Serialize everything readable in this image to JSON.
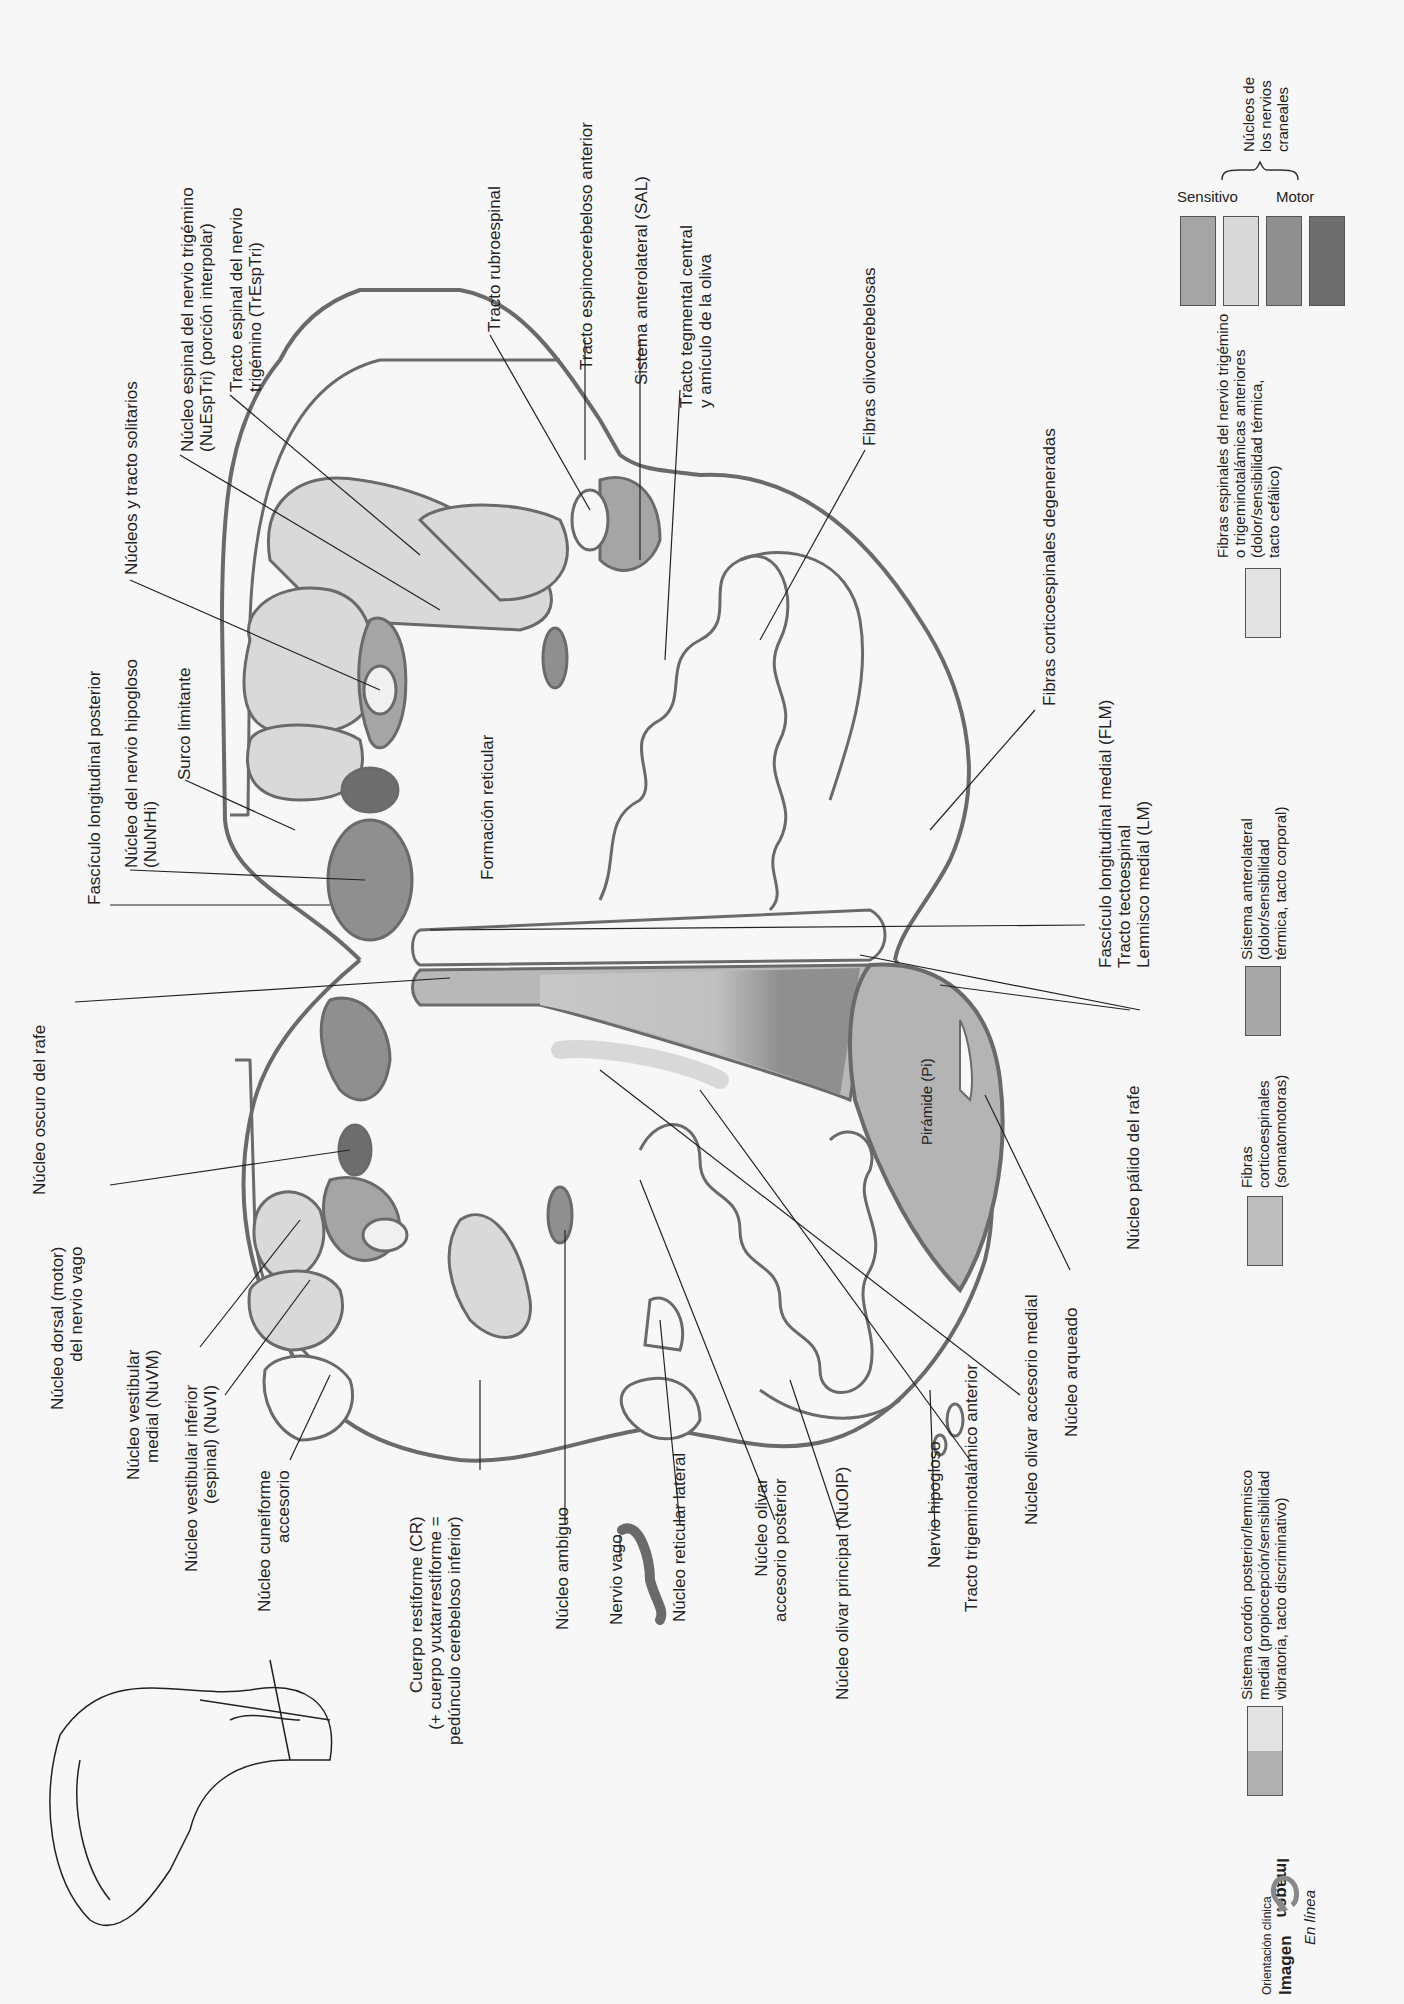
{
  "diagram": {
    "colors": {
      "outline": "#6a6a6a",
      "sensory_medium": "#a5a5a5",
      "sensory_light": "#d9d9d9",
      "motor_medium": "#8f8f8f",
      "motor_dark": "#6e6e6e",
      "pyramid": "#b4b4b4",
      "anterolateral": "#a8a8a8",
      "trigeminal_fibers": "#e3e3e3",
      "background": "#f7f7f7"
    }
  },
  "labels_top": [
    {
      "id": "fasciculo-longitudinal-posterior",
      "lines": [
        "Fascículo longitudinal posterior"
      ]
    },
    {
      "id": "nucleo-hipogloso",
      "lines": [
        "Núcleo del nervio hipogloso",
        "(NuNrHi)"
      ]
    },
    {
      "id": "surco-limitante",
      "lines": [
        "Surco limitante"
      ]
    },
    {
      "id": "nucleos-tracto-solitarios",
      "lines": [
        "Núcleos y tracto solitarios"
      ]
    },
    {
      "id": "nucleo-espinal-trigemino",
      "lines": [
        "Núcleo espinal del nervio trigémino",
        "(NuEspTri) (porción interpolar)"
      ]
    },
    {
      "id": "tracto-espinal-trigemino",
      "lines": [
        "Tracto espinal del nervio",
        "trigémino (TrEspTri)"
      ]
    },
    {
      "id": "tracto-rubroespinal",
      "lines": [
        "Tracto rubroespinal"
      ]
    },
    {
      "id": "tracto-espinocerebeloso-anterior",
      "lines": [
        "Tracto espinocerebeloso anterior"
      ]
    },
    {
      "id": "sistema-anterolateral",
      "lines": [
        "Sistema anterolateral (SAL)"
      ]
    },
    {
      "id": "tracto-tegmental-central",
      "lines": [
        "Tracto tegmental central",
        "y amículo de la oliva"
      ]
    },
    {
      "id": "fibras-olivocerebelosas",
      "lines": [
        "Fibras olivocerebelosas"
      ]
    },
    {
      "id": "fibras-corticoespinales-degeneradas",
      "lines": [
        "Fibras corticoespinales degeneradas"
      ]
    },
    {
      "id": "flm-group",
      "lines": [
        "Fascículo longitudinal medial (FLM)",
        "Tracto tectoespinal",
        "Lemnisco medial (LM)"
      ]
    },
    {
      "id": "formacion-reticular",
      "lines": [
        "Formación reticular"
      ]
    },
    {
      "id": "piramide",
      "lines": [
        "Pirámide (Pi)"
      ]
    }
  ],
  "labels_bottom": [
    {
      "id": "nucleo-oscuro-rafe",
      "lines": [
        "Núcleo oscuro del rafe"
      ]
    },
    {
      "id": "nucleo-dorsal-vago",
      "lines": [
        "Núcleo dorsal (motor)",
        "del nervio vago"
      ]
    },
    {
      "id": "nucleo-vestibular-medial",
      "lines": [
        "Núcleo vestibular",
        "medial (NuVM)"
      ]
    },
    {
      "id": "nucleo-vestibular-inferior",
      "lines": [
        "Núcleo vestibular inferior",
        "(espinal) (NuVI)"
      ]
    },
    {
      "id": "nucleo-cuneiforme-accesorio",
      "lines": [
        "Núcleo cuneiforme",
        "accesorio"
      ]
    },
    {
      "id": "cuerpo-restiforme",
      "lines": [
        "Cuerpo restiforme (CR)",
        "(+ cuerpo yuxtarrestiforme =",
        "pedúnculo cerebeloso inferior)"
      ]
    },
    {
      "id": "nucleo-ambiguo",
      "lines": [
        "Núcleo ambiguo"
      ]
    },
    {
      "id": "nervio-vago",
      "lines": [
        "Nervio vago"
      ]
    },
    {
      "id": "nucleo-reticular-lateral",
      "lines": [
        "Núcleo reticular lateral"
      ]
    },
    {
      "id": "nucleo-olivar-accesorio-posterior",
      "lines": [
        "Núcleo olivar",
        "accesorio posterior"
      ]
    },
    {
      "id": "nucleo-olivar-principal",
      "lines": [
        "Núcleo olivar principal (NuOIP)"
      ]
    },
    {
      "id": "nervio-hipogloso",
      "lines": [
        "Nervio hipogloso"
      ]
    },
    {
      "id": "tracto-trigeminotalamico-anterior",
      "lines": [
        "Tracto trigeminotalámico anterior"
      ]
    },
    {
      "id": "nucleo-olivar-accesorio-medial",
      "lines": [
        "Núcleo olivar accesorio medial"
      ]
    },
    {
      "id": "nucleo-arqueado",
      "lines": [
        "Núcleo arqueado"
      ]
    },
    {
      "id": "nucleo-palido-rafe",
      "lines": [
        "Núcleo pálido del rafe"
      ]
    }
  ],
  "legend": {
    "cranial_nuclei": {
      "title_lines": [
        "Núcleos de",
        "los nervios",
        "craneales"
      ],
      "sensory_label": "Sensitivo",
      "motor_label": "Motor",
      "swatches": [
        "#a5a5a5",
        "#d9d9d9",
        "#8f8f8f",
        "#6e6e6e"
      ]
    },
    "items": [
      {
        "id": "legend-cordon-posterior",
        "lines": [
          "Sistema cordón posterior/lemnisco",
          "medial (propiocepción/sensibilidad",
          "vibratoria, tacto discriminativo)"
        ],
        "colors": [
          "#e3e3e3",
          "#b0b0b0"
        ]
      },
      {
        "id": "legend-corticoespinales",
        "lines": [
          "Fibras",
          "corticoespinales",
          "(somatomotoras)"
        ],
        "colors": [
          "#bdbdbd"
        ]
      },
      {
        "id": "legend-anterolateral",
        "lines": [
          "Sistema anterolateral",
          "(dolor/sensibilidad",
          "térmica, tacto corporal)"
        ],
        "colors": [
          "#a8a8a8"
        ]
      },
      {
        "id": "legend-trigeminales",
        "lines": [
          "Fibras espinales del nervio trigémino",
          "o trigeminotalámicas anteriores",
          "(dolor/sensibilidad térmica,",
          "tacto cefálico)"
        ],
        "colors": [
          "#e3e3e3"
        ]
      }
    ]
  },
  "footer": {
    "orientation_label": "Orientación clínica",
    "image_word": "Imagen",
    "image_word_flipped": "Imagen",
    "online_label": "En línea"
  }
}
